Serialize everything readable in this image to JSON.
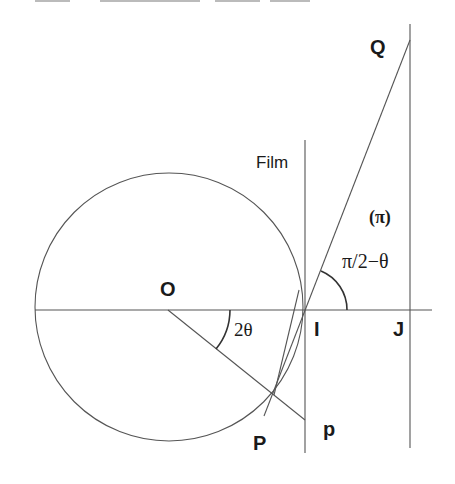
{
  "diagram": {
    "points": {
      "O": {
        "label": "O",
        "x": 168,
        "y": 310
      },
      "I": {
        "label": "I",
        "x": 305,
        "y": 310
      },
      "J": {
        "label": "J",
        "x": 410,
        "y": 310
      },
      "Q": {
        "label": "Q",
        "x": 410,
        "y": 40
      },
      "P": {
        "label": "P",
        "x": 273,
        "y": 393
      },
      "p": {
        "label": "p",
        "x": 305,
        "y": 420
      }
    },
    "labels": {
      "film": "Film",
      "O": "O",
      "I": "I",
      "J": "J",
      "Q": "Q",
      "P": "P",
      "p": "p",
      "pi_plane": "(π)",
      "angle_right": "π/2−θ",
      "angle_left": "2θ"
    },
    "circle": {
      "cx": 168,
      "cy": 307,
      "r": 134
    },
    "colors": {
      "line": "#555555",
      "text": "#1a1a1a",
      "background": "#ffffff"
    }
  }
}
